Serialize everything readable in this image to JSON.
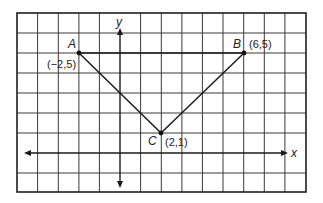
{
  "diagram": {
    "type": "coordinate-plane",
    "axes": {
      "x_label": "x",
      "y_label": "y"
    },
    "grid": {
      "columns": 14,
      "rows": 9,
      "x_min_visible": -5,
      "x_max_visible": 9,
      "y_min_visible": -2,
      "y_max_visible": 7
    },
    "points": [
      {
        "name": "A",
        "x": -2,
        "y": 5,
        "coord_label": "(−2,5)"
      },
      {
        "name": "B",
        "x": 6,
        "y": 5,
        "coord_label": "(6,5)"
      },
      {
        "name": "C",
        "x": 2,
        "y": 1,
        "coord_label": "(2,1)"
      }
    ],
    "segments": [
      {
        "from": "A",
        "to": "B"
      },
      {
        "from": "A",
        "to": "C"
      },
      {
        "from": "C",
        "to": "B"
      }
    ],
    "colors": {
      "line": "#1a1a1a",
      "grid": "#3a3a3a",
      "background": "#ffffff"
    }
  }
}
